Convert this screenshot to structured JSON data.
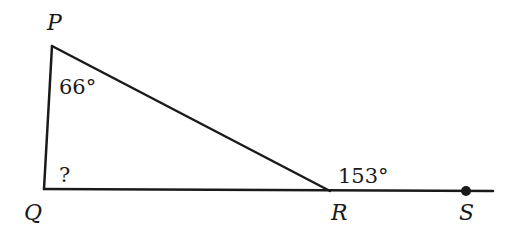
{
  "diagram": {
    "type": "geometry-triangle",
    "colors": {
      "stroke": "#1a1a1a",
      "background": "#ffffff"
    },
    "vertices": {
      "P": {
        "label": "P",
        "x": 52,
        "y": 46
      },
      "Q": {
        "label": "Q",
        "x": 44,
        "y": 189
      },
      "R": {
        "label": "R",
        "x": 330,
        "y": 191
      },
      "S": {
        "label": "S",
        "x": 466,
        "y": 191
      }
    },
    "angles": {
      "P": "66°",
      "Q": "?",
      "R_exterior": "153°"
    },
    "segments": [
      "PQ",
      "PR",
      "QS"
    ],
    "points": [
      "S"
    ]
  }
}
